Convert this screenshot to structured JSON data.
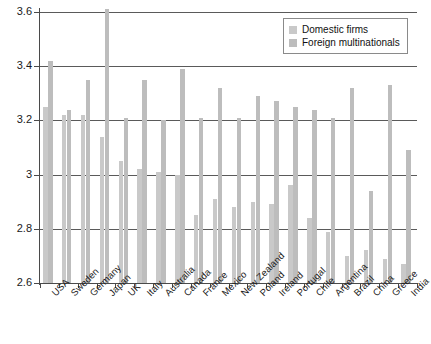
{
  "chart_data": {
    "type": "bar",
    "title": "",
    "subtitle": "",
    "xlabel": "",
    "ylabel": "",
    "ylim": [
      2.6,
      3.6
    ],
    "yticks": [
      "2.6",
      "2.8",
      "3",
      "3.2",
      "3.4",
      "3.6"
    ],
    "ytick_values": [
      2.6,
      2.8,
      3.0,
      3.2,
      3.4,
      3.6
    ],
    "grid": true,
    "legend_position": "top-right",
    "categories": [
      "USA",
      "Sweden",
      "Germany",
      "Japan",
      "UK",
      "Italy",
      "Australia",
      "Canada",
      "France",
      "Mexico",
      "New Zealand",
      "Poland",
      "Ireland",
      "Portugal",
      "Chile",
      "Argentina",
      "Brazil",
      "China",
      "Greece",
      "India"
    ],
    "series": [
      {
        "name": "Domestic firms",
        "color": "#c9c9c9",
        "values": [
          3.25,
          3.22,
          3.22,
          3.14,
          3.05,
          3.02,
          3.01,
          3.0,
          2.85,
          2.91,
          2.88,
          2.9,
          2.89,
          2.96,
          2.84,
          2.79,
          2.7,
          2.72,
          2.69,
          2.67
        ]
      },
      {
        "name": "Foreign multinationals",
        "color": "#bdbdbd",
        "values": [
          3.42,
          3.24,
          3.35,
          3.61,
          3.21,
          3.35,
          3.2,
          3.39,
          3.21,
          3.32,
          3.21,
          3.29,
          3.27,
          3.25,
          3.24,
          3.21,
          3.32,
          2.94,
          3.33,
          3.09
        ]
      }
    ]
  },
  "legend": {
    "items": [
      {
        "label": "Domestic firms",
        "key": "domestic"
      },
      {
        "label": "Foreign multinationals",
        "key": "foreign"
      }
    ]
  }
}
